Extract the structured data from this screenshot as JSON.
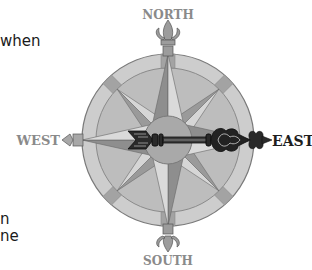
{
  "text_fragments": {
    "top": "when",
    "bottom_line1": "n",
    "bottom_line2": "ne"
  },
  "compass": {
    "labels": {
      "north": "NORTH",
      "south": "SOUTH",
      "east": "EAST",
      "west": "WEST"
    },
    "pointer_direction": "east",
    "colors": {
      "outer_ring": "#c9c9c9",
      "inner_disc": "#b8b8b8",
      "ring_line": "#7a7a7a",
      "star_dark": "#8c8c8c",
      "star_light": "#d4d4d4",
      "hub": "#a9a9a9",
      "arrow": "#1e1e1e",
      "label_gray": "#8a8a8a",
      "label_dark": "#1e1e1e"
    }
  }
}
